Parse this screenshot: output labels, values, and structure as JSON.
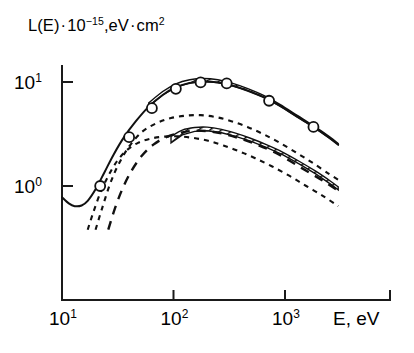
{
  "figure": {
    "background_color": "#ffffff",
    "ink_color": "#111111"
  },
  "labels": {
    "ylabel_lead": "L(E)",
    "ylabel_dot1": "·",
    "ylabel_base": "10",
    "ylabel_exp": "−15",
    "ylabel_units": ",eV",
    "ylabel_dot2": "·",
    "ylabel_units2": "cm",
    "ylabel_units2_exp": "2",
    "xlabel": "E, eV"
  },
  "chart_data": {
    "type": "line",
    "title": "",
    "xlabel": "E, eV",
    "ylabel": "L(E) · 10⁻¹⁵, eV · cm²",
    "xscale": "log",
    "yscale": "log",
    "xlim": [
      10,
      3000
    ],
    "ylim": [
      0.38,
      16
    ],
    "xticks": [
      10,
      100,
      1000
    ],
    "xtick_labels": [
      "10¹",
      "10²",
      "10³"
    ],
    "yticks": [
      1,
      10
    ],
    "ytick_labels": [
      "10⁰",
      "10¹"
    ],
    "grid": false,
    "legend": "none",
    "series": [
      {
        "name": "total-stopping-curve",
        "style": "solid",
        "x": [
          10,
          11.5,
          13,
          15,
          17,
          20,
          24,
          29,
          36,
          46,
          60,
          80,
          105,
          140,
          185,
          250,
          340,
          470,
          650,
          900,
          1300,
          1800,
          2500,
          3000
        ],
        "y": [
          0.78,
          0.68,
          0.64,
          0.65,
          0.72,
          0.93,
          1.35,
          2.0,
          2.95,
          4.2,
          5.8,
          7.5,
          8.9,
          9.8,
          10.1,
          9.9,
          9.2,
          8.2,
          7.1,
          5.9,
          4.6,
          3.7,
          2.9,
          2.5
        ]
      },
      {
        "name": "partial-contribution-upper",
        "style": "dashed-short",
        "x": [
          20,
          23,
          27,
          32,
          40,
          52,
          70,
          95,
          130,
          175,
          240,
          330,
          460,
          640,
          900,
          1300,
          1800,
          2500,
          3000
        ],
        "y": [
          0.38,
          0.62,
          1.05,
          1.6,
          2.4,
          3.3,
          4.0,
          4.5,
          4.75,
          4.8,
          4.6,
          4.2,
          3.7,
          3.15,
          2.6,
          2.05,
          1.65,
          1.3,
          1.15
        ]
      },
      {
        "name": "partial-contribution-lower",
        "style": "dashed-short",
        "x": [
          17,
          19,
          22,
          26,
          31,
          38,
          48,
          62,
          82,
          110,
          150,
          205,
          280,
          390,
          540,
          760,
          1100,
          1550,
          2200,
          3000
        ],
        "y": [
          0.38,
          0.55,
          0.85,
          1.25,
          1.72,
          2.2,
          2.6,
          2.85,
          2.98,
          3.0,
          2.9,
          2.72,
          2.45,
          2.15,
          1.85,
          1.55,
          1.25,
          1.0,
          0.8,
          0.64
        ]
      },
      {
        "name": "partial-contribution-steep",
        "style": "dashed-long",
        "x": [
          26,
          30,
          35,
          42,
          52,
          66,
          86,
          115,
          155,
          210,
          290,
          400,
          560,
          780,
          1100,
          1550,
          2200,
          3000
        ],
        "y": [
          0.38,
          0.62,
          0.95,
          1.4,
          1.95,
          2.5,
          2.95,
          3.25,
          3.4,
          3.35,
          3.15,
          2.85,
          2.5,
          2.15,
          1.75,
          1.4,
          1.12,
          0.9
        ]
      }
    ],
    "bands": [
      {
        "name": "uncertainty-band-peak",
        "hatched": true,
        "x": [
          60,
          80,
          105,
          140,
          185,
          250,
          340,
          470,
          650,
          900,
          1300,
          1800,
          2500,
          3000
        ],
        "y_lower": [
          5.8,
          7.5,
          8.9,
          9.8,
          10.1,
          9.9,
          9.2,
          8.2,
          7.1,
          5.9,
          4.6,
          3.7,
          2.9,
          2.5
        ],
        "y_upper": [
          6.3,
          8.1,
          9.6,
          10.5,
          10.8,
          10.5,
          9.7,
          8.6,
          7.4,
          6.1,
          4.75,
          3.8,
          2.98,
          2.56
        ]
      },
      {
        "name": "uncertainty-band-middle",
        "hatched": true,
        "x": [
          95,
          120,
          155,
          200,
          270,
          360,
          490,
          680,
          950,
          1350,
          1900,
          2600,
          3000
        ],
        "y_lower": [
          2.6,
          3.1,
          3.35,
          3.4,
          3.25,
          3.0,
          2.7,
          2.35,
          2.0,
          1.62,
          1.3,
          1.03,
          0.92
        ],
        "y_upper": [
          3.0,
          3.45,
          3.65,
          3.68,
          3.5,
          3.22,
          2.88,
          2.5,
          2.12,
          1.72,
          1.38,
          1.1,
          0.98
        ]
      }
    ],
    "markers": {
      "name": "measured-data-points",
      "shape": "open-circle",
      "x": [
        22,
        40,
        64,
        105,
        175,
        300,
        720,
        1800
      ],
      "y": [
        1.0,
        2.95,
        5.6,
        8.6,
        9.9,
        9.7,
        6.6,
        3.7
      ]
    }
  }
}
